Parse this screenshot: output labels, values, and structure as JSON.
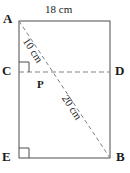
{
  "figure": {
    "type": "geometry-diagram",
    "shape": "rectangle",
    "vertices": {
      "A": "A",
      "B": "B",
      "C": "C",
      "D": "D",
      "E": "E",
      "P": "P"
    },
    "measures": {
      "top_edge": "18 cm",
      "upper_diagonal": "10 cm",
      "lower_diagonal": "20 cm"
    },
    "colors": {
      "stroke": "#4d4d4d",
      "dashed": "#808080",
      "text": "#1a1a1a",
      "background": "#ffffff"
    },
    "geometry": {
      "rect_left": 19,
      "rect_top": 21,
      "rect_right": 110,
      "rect_bottom": 158,
      "line_cd_y": 72,
      "point_p_x": 48,
      "point_p_y": 72,
      "right_angle_markers": [
        "C",
        "E"
      ]
    }
  }
}
